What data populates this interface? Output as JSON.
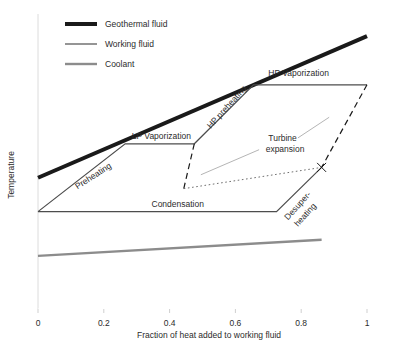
{
  "chart_data": {
    "type": "line",
    "title": "",
    "xlabel": "Fraction of heat added to working fluid",
    "ylabel": "Temperature",
    "xlim": [
      0,
      1
    ],
    "ylim": [
      0,
      1
    ],
    "grid": false,
    "xticks": [
      "0",
      "0.2",
      "0.4",
      "0.6",
      "0.8",
      "1"
    ],
    "xtick_values": [
      0,
      0.2,
      0.4,
      0.6,
      0.8,
      1
    ],
    "yticks": [],
    "legend_position": "upper-left-inside",
    "legend": [
      {
        "name": "Geothermal fluid",
        "color": "#1a1a1a",
        "width": 4
      },
      {
        "name": "Working fluid",
        "color": "#4d4d4d",
        "width": 1.2
      },
      {
        "name": "Coolant",
        "color": "#8c8c8c",
        "width": 2.4
      }
    ],
    "series": [
      {
        "name": "Geothermal fluid",
        "style": "solid",
        "color": "#1a1a1a",
        "width": 4,
        "points": [
          [
            0.0,
            0.445
          ],
          [
            1.0,
            0.925
          ]
        ]
      },
      {
        "name": "Working fluid",
        "style": "solid",
        "color": "#4d4d4d",
        "width": 1.2,
        "points": [
          [
            0.0,
            0.33
          ],
          [
            0.265,
            0.56
          ],
          [
            0.475,
            0.56
          ],
          [
            0.655,
            0.76
          ],
          [
            1.0,
            0.76
          ]
        ],
        "segments": [
          {
            "label": "Preheating",
            "from": [
              0.0,
              0.33
            ],
            "to": [
              0.265,
              0.56
            ]
          },
          {
            "label": "LP Vaporization",
            "from": [
              0.265,
              0.56
            ],
            "to": [
              0.475,
              0.56
            ]
          },
          {
            "label": "HP preheating",
            "from": [
              0.475,
              0.56
            ],
            "to": [
              0.655,
              0.76
            ]
          },
          {
            "label": "HP Vaporization",
            "from": [
              0.655,
              0.76
            ],
            "to": [
              1.0,
              0.76
            ]
          }
        ]
      },
      {
        "name": "Working fluid (condensation)",
        "style": "solid",
        "color": "#4d4d4d",
        "width": 1.2,
        "points": [
          [
            0.0,
            0.33
          ],
          [
            0.725,
            0.33
          ],
          [
            0.862,
            0.48
          ]
        ],
        "segments": [
          {
            "label": "Condensation",
            "from": [
              0.0,
              0.33
            ],
            "to": [
              0.725,
              0.33
            ]
          },
          {
            "label": "Desuper-heating",
            "from": [
              0.725,
              0.33
            ],
            "to": [
              0.862,
              0.48
            ]
          }
        ]
      },
      {
        "name": "Coolant",
        "style": "solid",
        "color": "#8c8c8c",
        "width": 2.4,
        "points": [
          [
            0.0,
            0.18
          ],
          [
            0.862,
            0.235
          ]
        ]
      },
      {
        "name": "Turbine expansion (HP)",
        "style": "dashed",
        "color": "#1a1a1a",
        "width": 1.2,
        "points": [
          [
            1.0,
            0.76
          ],
          [
            0.862,
            0.48
          ]
        ]
      },
      {
        "name": "Turbine expansion (LP)",
        "style": "dashed",
        "color": "#1a1a1a",
        "width": 1.2,
        "points": [
          [
            0.475,
            0.56
          ],
          [
            0.443,
            0.408
          ]
        ]
      },
      {
        "name": "Turbine expansion (LP path)",
        "style": "dotted",
        "color": "#6f6f6f",
        "width": 1.0,
        "points": [
          [
            0.443,
            0.408
          ],
          [
            0.862,
            0.48
          ]
        ]
      }
    ],
    "annotations": [
      {
        "text": "Preheating",
        "x": 0.12,
        "y": 0.405,
        "rotation": -33
      },
      {
        "text": "LP Vaporization",
        "x": 0.285,
        "y": 0.575,
        "rotation": 0
      },
      {
        "text": "HP preheating",
        "x": 0.525,
        "y": 0.61,
        "rotation": -48
      },
      {
        "text": "HP Vaporization",
        "x": 0.7,
        "y": 0.79,
        "rotation": 0
      },
      {
        "text": "Condensation",
        "x": 0.345,
        "y": 0.345,
        "rotation": 0
      },
      {
        "text": "Desuper-",
        "x": 0.76,
        "y": 0.3,
        "rotation": -48
      },
      {
        "text": "heating",
        "x": 0.79,
        "y": 0.278,
        "rotation": -48
      },
      {
        "text": "Turbine",
        "x": 0.7,
        "y": 0.57,
        "rotation": 0
      },
      {
        "text": "expansion",
        "x": 0.692,
        "y": 0.533,
        "rotation": 0
      }
    ],
    "leader_lines": [
      {
        "name": "turbine-leader-lower",
        "from": [
          0.672,
          0.54
        ],
        "to": [
          0.495,
          0.455
        ],
        "color": "#b5b5b5"
      },
      {
        "name": "turbine-leader-upper",
        "from": [
          0.79,
          0.58
        ],
        "to": [
          0.885,
          0.65
        ],
        "color": "#b5b5b5"
      }
    ],
    "marker": {
      "name": "turbine-endpoint-marker",
      "x": 0.862,
      "y": 0.48,
      "shape": "x",
      "color": "#1a1a1a"
    }
  }
}
